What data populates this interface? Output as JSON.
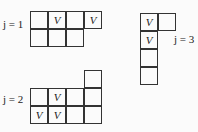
{
  "diagrams": [
    {
      "label": "j = 1",
      "label_pos": [
        3,
        24
      ],
      "origin": [
        30,
        11
      ],
      "cells": [
        {
          "r": 0,
          "c": 0,
          "v": ""
        },
        {
          "r": 0,
          "c": 1,
          "v": "V"
        },
        {
          "r": 0,
          "c": 2,
          "v": ""
        },
        {
          "r": 0,
          "c": 3,
          "v": "V"
        },
        {
          "r": 1,
          "c": 0,
          "v": ""
        },
        {
          "r": 1,
          "c": 1,
          "v": ""
        },
        {
          "r": 1,
          "c": 2,
          "v": ""
        }
      ]
    },
    {
      "label": "j = 2",
      "label_pos": [
        3,
        99
      ],
      "origin": [
        30,
        70
      ],
      "cells": [
        {
          "r": 0,
          "c": 3,
          "v": ""
        },
        {
          "r": 1,
          "c": 0,
          "v": ""
        },
        {
          "r": 1,
          "c": 1,
          "v": "V"
        },
        {
          "r": 1,
          "c": 2,
          "v": ""
        },
        {
          "r": 1,
          "c": 3,
          "v": ""
        },
        {
          "r": 2,
          "c": 0,
          "v": "V"
        },
        {
          "r": 2,
          "c": 1,
          "v": "V"
        },
        {
          "r": 2,
          "c": 2,
          "v": ""
        },
        {
          "r": 2,
          "c": 3,
          "v": ""
        }
      ]
    },
    {
      "label": "j = 3",
      "label_pos": [
        174,
        39
      ],
      "origin": [
        140,
        13
      ],
      "cells": [
        {
          "r": 0,
          "c": 0,
          "v": "V"
        },
        {
          "r": 0,
          "c": 1,
          "v": ""
        },
        {
          "r": 1,
          "c": 0,
          "v": "V"
        },
        {
          "r": 2,
          "c": 0,
          "v": ""
        },
        {
          "r": 3,
          "c": 0,
          "v": ""
        }
      ]
    }
  ],
  "cell_size": 18
}
